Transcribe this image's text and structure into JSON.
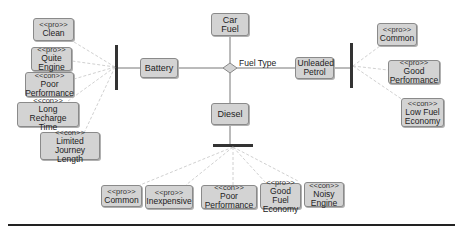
{
  "diagram": {
    "root": {
      "label": "Car Fuel"
    },
    "decision": {
      "label": "Fuel Type"
    },
    "options": [
      {
        "id": "battery",
        "label": "Battery"
      },
      {
        "id": "unleaded",
        "label": "Unleaded Petrol"
      },
      {
        "id": "diesel",
        "label": "Diesel"
      }
    ],
    "battery_traits": [
      {
        "stereotype": "<<pro>>",
        "label": "Clean"
      },
      {
        "stereotype": "<<pro>>",
        "label": "Quite\nEngine"
      },
      {
        "stereotype": "<<con>>",
        "label": "Poor\nPerformance"
      },
      {
        "stereotype": "<<con>>",
        "label": "Long Recharge\nTime"
      },
      {
        "stereotype": "<<con>>",
        "label": "Limited Journey\nLength"
      }
    ],
    "unleaded_traits": [
      {
        "stereotype": "<<pro>>",
        "label": "Common"
      },
      {
        "stereotype": "<<pro>>",
        "label": "Good\nPerformance"
      },
      {
        "stereotype": "<<con>>",
        "label": "Low Fuel\nEconomy"
      }
    ],
    "diesel_traits": [
      {
        "stereotype": "<<pro>>",
        "label": "Common"
      },
      {
        "stereotype": "<<pro>>",
        "label": "Inexpensive"
      },
      {
        "stereotype": "<<con>>",
        "label": "Poor\nPerformance"
      },
      {
        "stereotype": "<<pro>>",
        "label": "Good Fuel\nEconomy"
      },
      {
        "stereotype": "<<con>>",
        "label": "Noisy\nEngine"
      }
    ]
  },
  "colors": {
    "node_fill": "#d3d3d3",
    "node_border": "#8a8a8a",
    "bar": "#333333",
    "connector": "#bbbbbb"
  }
}
